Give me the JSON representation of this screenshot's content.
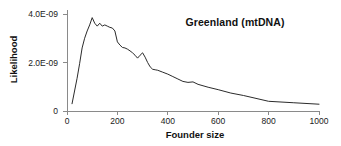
{
  "chart_data": {
    "type": "line",
    "title": "Greenland (mtDNA)",
    "xlabel": "Founder size",
    "ylabel": "Likelihood",
    "xlim": [
      0,
      1000
    ],
    "ylim": [
      0,
      4.2e-09
    ],
    "grid": false,
    "legend": null,
    "xticks": [
      0,
      200,
      400,
      600,
      800,
      1000
    ],
    "xtick_labels": [
      "0",
      "200",
      "400",
      "600",
      "800",
      "1000"
    ],
    "yticks": [
      0,
      2e-09,
      4e-09
    ],
    "ytick_labels": [
      "0",
      "2.0E-09",
      "4.0E-09"
    ],
    "series": [
      {
        "name": "Greenland mtDNA likelihood",
        "color": "#2b2b2b",
        "x": [
          20,
          40,
          50,
          60,
          70,
          80,
          90,
          100,
          110,
          120,
          130,
          140,
          150,
          160,
          170,
          180,
          190,
          200,
          210,
          220,
          230,
          240,
          250,
          260,
          270,
          280,
          290,
          300,
          310,
          320,
          330,
          340,
          350,
          360,
          380,
          400,
          420,
          440,
          460,
          480,
          500,
          520,
          560,
          600,
          650,
          700,
          750,
          800,
          900,
          1000
        ],
        "y": [
          3e-10,
          1.35e-09,
          1.95e-09,
          2.6e-09,
          3e-09,
          3.3e-09,
          3.55e-09,
          3.85e-09,
          3.62e-09,
          3.5e-09,
          3.62e-09,
          3.5e-09,
          3.55e-09,
          3.5e-09,
          3.45e-09,
          3.42e-09,
          3.3e-09,
          2.85e-09,
          2.72e-09,
          2.62e-09,
          2.6e-09,
          2.55e-09,
          2.48e-09,
          2.4e-09,
          2.3e-09,
          2.18e-09,
          2.3e-09,
          2.4e-09,
          2.22e-09,
          2e-09,
          1.82e-09,
          1.72e-09,
          1.7e-09,
          1.68e-09,
          1.6e-09,
          1.52e-09,
          1.42e-09,
          1.32e-09,
          1.22e-09,
          1.18e-09,
          1.2e-09,
          1.1e-09,
          9.8e-10,
          8.8e-10,
          7.4e-10,
          6.4e-10,
          5.2e-10,
          4e-10,
          3.4e-10,
          2.8e-10
        ]
      }
    ]
  },
  "axes": {
    "line_color": "#8a8a8a"
  }
}
